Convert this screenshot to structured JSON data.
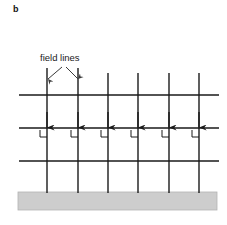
{
  "figure": {
    "panel_label": "b",
    "annotation_label": "field lines",
    "background_color": "#ffffff",
    "line_color": "#1a1a1a",
    "ground_fill_color": "#cdcdcd",
    "ground_stroke_color": "#b3b3b3"
  },
  "diagram": {
    "type": "schematic",
    "field_lines": {
      "count": 6,
      "x_positions": [
        47,
        78,
        108,
        138,
        169,
        199
      ],
      "top_y": [
        68,
        68,
        73,
        73,
        73,
        73
      ],
      "bottom_y": 193,
      "direction": "down",
      "arrow_y": 128,
      "stroke_width": 1.4
    },
    "equipotential_lines": {
      "count": 3,
      "y_positions": [
        95,
        128,
        161
      ],
      "x_start": 19,
      "x_end": 219,
      "stroke_width": 1.4
    },
    "right_angle_marks": {
      "count": 6,
      "size": 7,
      "offset_y": 2,
      "side": "left",
      "stroke_width": 1.0
    },
    "leader_lines": {
      "count": 2,
      "from": [
        {
          "x": 62,
          "y": 67
        },
        {
          "x": 66,
          "y": 67
        }
      ],
      "to": [
        {
          "x": 48,
          "y": 79
        },
        {
          "x": 78,
          "y": 79
        }
      ]
    },
    "ground": {
      "x": 18,
      "y": 192,
      "width": 199,
      "height": 18
    }
  }
}
